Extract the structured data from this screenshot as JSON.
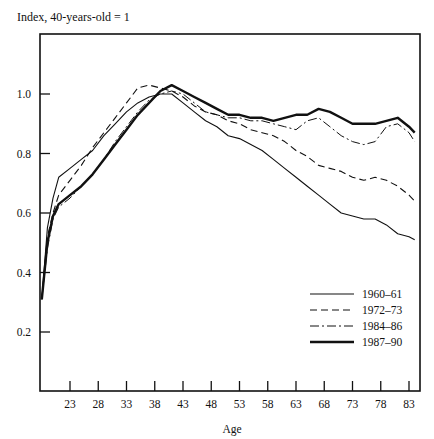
{
  "chart_data": {
    "type": "line",
    "title": "",
    "ylabel": "Index, 40-years-old = 1",
    "xlabel": "Age",
    "xlim": [
      18,
      85
    ],
    "ylim": [
      0.1,
      1.2
    ],
    "xticks": [
      23,
      28,
      33,
      38,
      43,
      48,
      53,
      58,
      63,
      68,
      73,
      78,
      83
    ],
    "yticks": [
      0.2,
      0.4,
      0.6,
      0.8,
      1.0
    ],
    "ytick_labels": [
      "0.2",
      "0.4",
      "0.6",
      "0.8",
      "1.0"
    ],
    "grid": false,
    "legend_position": "lower right",
    "series": [
      {
        "name": "1960–61",
        "style": "solid-thin",
        "x": [
          18,
          19,
          20,
          21,
          23,
          25,
          27,
          29,
          31,
          33,
          35,
          37,
          39,
          41,
          43,
          45,
          47,
          49,
          51,
          53,
          55,
          57,
          59,
          61,
          63,
          65,
          67,
          69,
          71,
          73,
          75,
          77,
          79,
          81,
          83,
          84
        ],
        "values": [
          0.31,
          0.55,
          0.65,
          0.72,
          0.75,
          0.78,
          0.81,
          0.86,
          0.9,
          0.94,
          0.97,
          0.99,
          1.0,
          1.0,
          0.97,
          0.94,
          0.91,
          0.89,
          0.86,
          0.85,
          0.83,
          0.81,
          0.78,
          0.75,
          0.72,
          0.69,
          0.66,
          0.63,
          0.6,
          0.59,
          0.58,
          0.58,
          0.56,
          0.53,
          0.52,
          0.51
        ]
      },
      {
        "name": "1972–73",
        "style": "dashed",
        "x": [
          18,
          19,
          20,
          21,
          23,
          25,
          27,
          29,
          31,
          33,
          35,
          37,
          39,
          41,
          43,
          45,
          47,
          49,
          51,
          53,
          55,
          57,
          59,
          61,
          63,
          65,
          67,
          69,
          71,
          73,
          75,
          77,
          79,
          81,
          83,
          84
        ],
        "values": [
          0.31,
          0.52,
          0.6,
          0.66,
          0.71,
          0.76,
          0.82,
          0.87,
          0.92,
          0.97,
          1.02,
          1.03,
          1.02,
          1.01,
          0.99,
          0.96,
          0.94,
          0.93,
          0.91,
          0.9,
          0.88,
          0.87,
          0.86,
          0.84,
          0.81,
          0.79,
          0.76,
          0.75,
          0.74,
          0.72,
          0.71,
          0.72,
          0.71,
          0.69,
          0.66,
          0.64
        ]
      },
      {
        "name": "1984–86",
        "style": "dash-dot",
        "x": [
          18,
          19,
          20,
          21,
          23,
          25,
          27,
          29,
          31,
          33,
          35,
          37,
          39,
          41,
          43,
          45,
          47,
          49,
          51,
          53,
          55,
          57,
          59,
          61,
          63,
          65,
          67,
          69,
          71,
          73,
          75,
          77,
          79,
          81,
          83,
          84
        ],
        "values": [
          0.31,
          0.48,
          0.58,
          0.62,
          0.65,
          0.69,
          0.73,
          0.78,
          0.84,
          0.89,
          0.94,
          0.98,
          1.0,
          1.01,
          1.0,
          0.97,
          0.94,
          0.93,
          0.92,
          0.92,
          0.91,
          0.91,
          0.9,
          0.89,
          0.88,
          0.91,
          0.92,
          0.89,
          0.86,
          0.84,
          0.83,
          0.84,
          0.89,
          0.9,
          0.87,
          0.84
        ]
      },
      {
        "name": "1987–90",
        "style": "solid-thick",
        "x": [
          18,
          19,
          20,
          21,
          23,
          25,
          27,
          29,
          31,
          33,
          35,
          37,
          39,
          41,
          43,
          45,
          47,
          49,
          51,
          53,
          55,
          57,
          59,
          61,
          63,
          65,
          67,
          69,
          71,
          73,
          75,
          77,
          79,
          81,
          83,
          84
        ],
        "values": [
          0.31,
          0.5,
          0.59,
          0.63,
          0.66,
          0.69,
          0.73,
          0.78,
          0.83,
          0.88,
          0.93,
          0.97,
          1.01,
          1.03,
          1.01,
          0.99,
          0.97,
          0.95,
          0.93,
          0.93,
          0.92,
          0.92,
          0.91,
          0.92,
          0.93,
          0.93,
          0.95,
          0.94,
          0.92,
          0.9,
          0.9,
          0.9,
          0.91,
          0.92,
          0.89,
          0.87
        ]
      }
    ]
  },
  "labels": {
    "y_title": "Index, 40-years-old = 1",
    "x_title": "Age"
  }
}
